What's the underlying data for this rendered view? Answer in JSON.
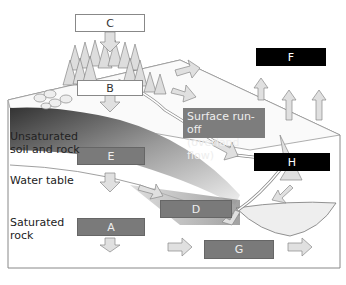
{
  "diagram": {
    "type": "water-cycle-block-diagram",
    "boxes": {
      "C": "C",
      "B": "B",
      "F": "F",
      "E": "E",
      "H": "H",
      "D": "D",
      "A": "A",
      "G": "G"
    },
    "labels": {
      "surface_runoff": "Surface run-off (overland flow)",
      "surface_runoff_line1": "Surface run-off",
      "surface_runoff_line2": "(overland flow)",
      "unsaturated_line1": "Unsaturated",
      "unsaturated_line2": "soil and rock",
      "water_table": "Water table",
      "saturated_line1": "Saturated",
      "saturated_line2": "rock"
    },
    "colors": {
      "box_white": "#ffffff",
      "box_gray": "#7a7a7a",
      "box_black": "#000000",
      "arrow_fill": "#e0e0e0",
      "ground_dark": "#4a4a4a",
      "water": "#e8e8e8"
    }
  }
}
